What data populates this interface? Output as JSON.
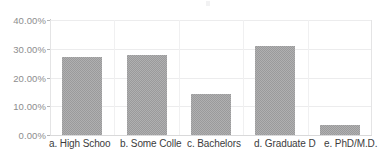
{
  "chart_data": {
    "type": "bar",
    "title": "",
    "subtitle": "",
    "xlabel": "",
    "ylabel": "",
    "categories": [
      "a. High Schoo",
      "b. Some Colle",
      "c. Bachelors",
      "d. Graduate D",
      "e. PhD/M.D."
    ],
    "values": [
      27.0,
      28.0,
      14.3,
      31.0,
      3.5
    ],
    "ylim": [
      0,
      40
    ],
    "ytick_values": [
      0,
      10,
      20,
      30,
      40
    ],
    "ytick_labels": [
      "0.00%",
      "10.00%",
      "20.00%",
      "30.00%",
      "40.00%"
    ],
    "grid": true,
    "legend": "none",
    "legend_position": "none"
  },
  "colors": {
    "bar_fill": "#b0b0b1",
    "bar_pattern": "#9a9a9b",
    "gridline": "#ececed",
    "axis_line": "#c9c9ca",
    "y_label_text": "#8d8d8e",
    "x_label_text": "#3c3c3d",
    "background": "#ffffff"
  }
}
